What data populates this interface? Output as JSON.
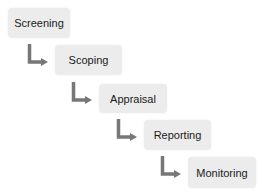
{
  "diagram": {
    "title": "",
    "steps": [
      {
        "label": "Screening"
      },
      {
        "label": "Scoping"
      },
      {
        "label": "Appraisal"
      },
      {
        "label": "Reporting"
      },
      {
        "label": "Monitoring"
      }
    ],
    "colors": {
      "box": "#ececec",
      "arrow": "#777777",
      "text": "#1a1a1a"
    }
  }
}
